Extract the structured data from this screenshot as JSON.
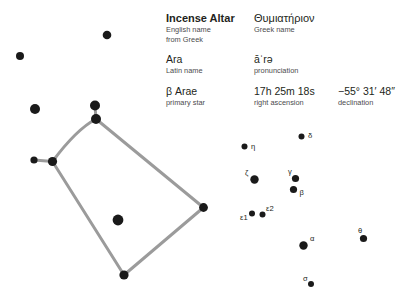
{
  "info": {
    "rows": [
      {
        "cells": [
          {
            "value": "Incense Altar",
            "label": "English name from Greek",
            "style": "title"
          },
          {
            "value": "Θυμιατήριον",
            "label": "Greek name",
            "style": "greek"
          }
        ]
      },
      {
        "cells": [
          {
            "value": "Ara",
            "label": "Latin name",
            "style": "plain"
          },
          {
            "value": "āˈrə",
            "label": "pronunciation",
            "style": "plain"
          }
        ]
      },
      {
        "cells": [
          {
            "value": "β Arae",
            "label": "primary star",
            "style": "plain"
          },
          {
            "value": "17h 25m 18s",
            "label": "right ascension",
            "style": "plain"
          },
          {
            "value": "−55° 31′ 48″",
            "label": "declination",
            "style": "plain"
          }
        ]
      }
    ],
    "r0c0_value": "Incense Altar",
    "r0c0_label_line1": "English name",
    "r0c0_label_line2": "from Greek",
    "r0c1_value": "Θυμιατήριον",
    "r0c1_label": "Greek name",
    "r1c0_value": "Ara",
    "r1c0_label": "Latin name",
    "r1c1_value": "āˈrə",
    "r1c1_label": "pronunciation",
    "r2c0_value": "β Arae",
    "r2c0_label": "primary star",
    "r2c1_value": "17h 25m 18s",
    "r2c1_label": "right ascension",
    "r2c2_value": "−55° 31′ 48″",
    "r2c2_label": "declination"
  },
  "colors": {
    "star": "#1a1a1a",
    "line": "#9b9b9b",
    "text": "#231f20",
    "label": "#4b4b4d",
    "background": "#ffffff"
  },
  "starmap": {
    "name": "Ara constellation",
    "line_color": "#9b9b9b",
    "line_width": 3.0,
    "star_color": "#1a1a1a",
    "constellation_path": "M 96 119 C 79 128, 64 146, 52.5 161.5 L 124 275 L 203.5 207.5 Z",
    "extra_segment": "M 52.5 161.5 L 34 160",
    "stem_segment": "M 96 119 L 95 106",
    "stars": [
      {
        "name": "star-upper-left-a",
        "cx": 20,
        "cy": 56,
        "r": 4.0,
        "label": ""
      },
      {
        "name": "star-upper-left-b",
        "cx": 107,
        "cy": 35,
        "r": 4.3,
        "label": ""
      },
      {
        "name": "star-mid-left",
        "cx": 35,
        "cy": 109,
        "r": 5.0,
        "label": ""
      },
      {
        "name": "star-apex-top",
        "cx": 95,
        "cy": 105.5,
        "r": 5.0,
        "label": ""
      },
      {
        "name": "star-apex-vertex",
        "cx": 96,
        "cy": 119,
        "r": 5.0,
        "label": ""
      },
      {
        "name": "star-left-small",
        "cx": 34,
        "cy": 160,
        "r": 3.6,
        "label": ""
      },
      {
        "name": "star-left-vertex",
        "cx": 52.5,
        "cy": 161.5,
        "r": 4.6,
        "label": ""
      },
      {
        "name": "star-interior",
        "cx": 118,
        "cy": 220,
        "r": 5.4,
        "label": ""
      },
      {
        "name": "star-right-vertex",
        "cx": 203.5,
        "cy": 207.5,
        "r": 4.4,
        "label": ""
      },
      {
        "name": "star-bottom-vertex",
        "cx": 124,
        "cy": 275,
        "r": 4.6,
        "label": ""
      },
      {
        "name": "star-delta",
        "cx": 301.5,
        "cy": 136.5,
        "r": 3.0,
        "label": "δ",
        "lx": 308,
        "ly": 137.5
      },
      {
        "name": "star-eta",
        "cx": 244.5,
        "cy": 146.5,
        "r": 3.0,
        "label": "η",
        "lx": 251,
        "ly": 148.5
      },
      {
        "name": "star-zeta",
        "cx": 254.5,
        "cy": 179.5,
        "r": 4.2,
        "label": "ζ",
        "lx": 245,
        "ly": 175
      },
      {
        "name": "star-gamma",
        "cx": 295.5,
        "cy": 178.5,
        "r": 3.6,
        "label": "γ",
        "lx": 288,
        "ly": 174
      },
      {
        "name": "star-beta",
        "cx": 293.5,
        "cy": 189.5,
        "r": 3.6,
        "label": "β",
        "lx": 299.5,
        "ly": 194.5
      },
      {
        "name": "star-eps1",
        "cx": 252,
        "cy": 213.5,
        "r": 3.0,
        "label": "ε1",
        "lx": 240,
        "ly": 219.5
      },
      {
        "name": "star-eps2",
        "cx": 262.5,
        "cy": 214.5,
        "r": 3.0,
        "label": "ε2",
        "lx": 266,
        "ly": 211
      },
      {
        "name": "star-alpha",
        "cx": 303.5,
        "cy": 245.5,
        "r": 4.2,
        "label": "α",
        "lx": 310,
        "ly": 241
      },
      {
        "name": "star-theta",
        "cx": 363.5,
        "cy": 238.5,
        "r": 3.6,
        "label": "θ",
        "lx": 358,
        "ly": 233
      },
      {
        "name": "star-sigma",
        "cx": 311,
        "cy": 284,
        "r": 3.0,
        "label": "σ",
        "lx": 303,
        "ly": 281
      }
    ]
  }
}
